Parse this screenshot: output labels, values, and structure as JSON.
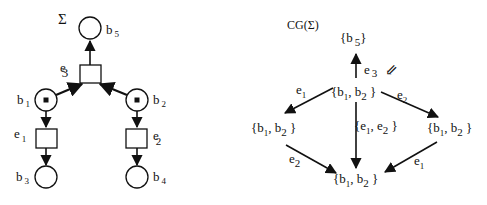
{
  "left_net": {
    "title": "Σ",
    "places": [
      {
        "id": "b5",
        "base": "b",
        "sub": "5",
        "marked": false
      },
      {
        "id": "b1",
        "base": "b",
        "sub": "1",
        "marked": true
      },
      {
        "id": "b2",
        "base": "b",
        "sub": "2",
        "marked": true
      },
      {
        "id": "b3",
        "base": "b",
        "sub": "3",
        "marked": false
      },
      {
        "id": "b4",
        "base": "b",
        "sub": "4",
        "marked": false
      }
    ],
    "transitions": [
      {
        "id": "e3",
        "base": "e",
        "sub": "3"
      },
      {
        "id": "e1",
        "base": "e",
        "sub": "1"
      },
      {
        "id": "e2",
        "base": "e",
        "sub": "2"
      }
    ],
    "arcs": [
      {
        "from": "b1",
        "to": "e3"
      },
      {
        "from": "b2",
        "to": "e3"
      },
      {
        "from": "e3",
        "to": "b5"
      },
      {
        "from": "b1",
        "to": "e1"
      },
      {
        "from": "e1",
        "to": "b3"
      },
      {
        "from": "b2",
        "to": "e2"
      },
      {
        "from": "e2",
        "to": "b4"
      }
    ]
  },
  "right_graph": {
    "title": "CG(Σ)",
    "nodes": {
      "top": {
        "open": "{b",
        "s1": "5",
        "close": "}"
      },
      "center": {
        "open": "{b",
        "s1": "1",
        "mid": ", b",
        "s2": "2",
        "close": " }"
      },
      "left": {
        "open": "{b",
        "s1": "1",
        "mid": ", b",
        "s2": "2",
        "close": " }"
      },
      "right": {
        "open": "{b",
        "s1": "1",
        "mid": ", b",
        "s2": "2",
        "close": " }"
      },
      "bottom": {
        "open": "{b",
        "s1": "1",
        "mid": ", b",
        "s2": "2",
        "close": " }"
      }
    },
    "edges": {
      "center_top": {
        "base": "e",
        "sub": "3",
        "marker": "⇙"
      },
      "center_left": {
        "base": "e",
        "sub": "1"
      },
      "center_right": {
        "base": "e",
        "sub": "2"
      },
      "center_bottom": {
        "open": "{e",
        "s1": "1",
        "mid": ", e",
        "s2": "2",
        "close": " }"
      },
      "left_bottom": {
        "base": "e",
        "sub": "2"
      },
      "right_bottom": {
        "base": "e",
        "sub": "1"
      }
    }
  }
}
